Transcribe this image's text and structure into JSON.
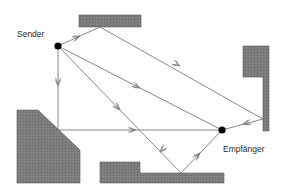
{
  "diagram": {
    "labels": {
      "sender": "Sender",
      "receiver": "Empfänger"
    },
    "colors": {
      "obstacle_fill": "#7a7a7a",
      "obstacle_stroke": "#5a5a5a",
      "ray": "#6a6a6a",
      "node": "#000000",
      "background": "#ffffff"
    },
    "nodes": [
      {
        "id": "sender",
        "label": "Sender",
        "x": 58,
        "y": 46
      },
      {
        "id": "receiver",
        "label": "Empfänger",
        "x": 222,
        "y": 130
      }
    ],
    "obstacles": [
      {
        "id": "top-wall",
        "points": "79,15 141,15 141,27 79,27"
      },
      {
        "id": "right-wall",
        "points": "243,46 269,46 269,131 263,131 263,77 243,77"
      },
      {
        "id": "left-wall",
        "points": "17,110 38,110 80,150 80,183 17,183"
      },
      {
        "id": "bottom-wall",
        "points": "100,162 140,162 140,173 224,173 224,183 100,183"
      }
    ],
    "rays": [
      {
        "id": "ray-direct",
        "path": "58,46 222,130"
      },
      {
        "id": "ray-top-right-reflection",
        "path": "58,46 100,27 263,119 222,130"
      },
      {
        "id": "ray-bottom-reflection",
        "path": "58,46 181,173 222,130"
      },
      {
        "id": "ray-left-corner-reflection",
        "path": "58,46 58,130 222,130"
      }
    ],
    "arrows": [
      {
        "x": 80,
        "y": 36,
        "angle": -24
      },
      {
        "x": 180,
        "y": 66,
        "angle": 29
      },
      {
        "x": 243,
        "y": 124,
        "angle": 165
      },
      {
        "x": 140,
        "y": 88,
        "angle": 27
      },
      {
        "x": 120,
        "y": 110,
        "angle": 46
      },
      {
        "x": 160,
        "y": 152,
        "angle": 134
      },
      {
        "x": 200,
        "y": 153,
        "angle": -46
      },
      {
        "x": 58,
        "y": 86,
        "angle": 90
      },
      {
        "x": 136,
        "y": 130,
        "angle": 0
      }
    ]
  }
}
